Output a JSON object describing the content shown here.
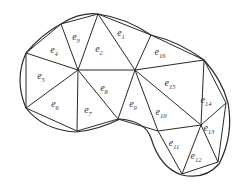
{
  "diagram": {
    "title": "",
    "type": "triangular finite element mesh over a curved domain",
    "colors": {
      "stroke": "#2a2a2a",
      "text": "#333333",
      "background": "#ffffff"
    },
    "nodes": {
      "A": [
        78,
        70
      ],
      "B": [
        135,
        70
      ],
      "C": [
        98,
        14
      ],
      "D": [
        151,
        35
      ],
      "E": [
        204,
        60
      ],
      "F": [
        61,
        24
      ],
      "G": [
        26,
        53
      ],
      "H": [
        26,
        108
      ],
      "I": [
        77,
        131
      ],
      "J": [
        118,
        119
      ],
      "K": [
        158,
        131
      ],
      "L": [
        201,
        125
      ],
      "M": [
        226,
        103
      ],
      "N": [
        182,
        174
      ],
      "O": [
        218,
        162
      ]
    },
    "elements": [
      {
        "id": "e1",
        "base": "e",
        "sub": "1",
        "nodes": [
          "C",
          "D",
          "B"
        ],
        "label_pos": [
          121,
          36
        ]
      },
      {
        "id": "e2",
        "base": "e",
        "sub": "2",
        "nodes": [
          "C",
          "B",
          "A"
        ],
        "label_pos": [
          99,
          52
        ]
      },
      {
        "id": "e3",
        "base": "e",
        "sub": "3",
        "nodes": [
          "F",
          "C",
          "A"
        ],
        "label_pos": [
          76,
          40
        ]
      },
      {
        "id": "e4",
        "base": "e",
        "sub": "4",
        "nodes": [
          "G",
          "F",
          "A"
        ],
        "label_pos": [
          54,
          53
        ]
      },
      {
        "id": "e5",
        "base": "e",
        "sub": "5",
        "nodes": [
          "G",
          "A",
          "H"
        ],
        "label_pos": [
          41,
          79
        ]
      },
      {
        "id": "e6",
        "base": "e",
        "sub": "6",
        "nodes": [
          "H",
          "A",
          "I"
        ],
        "label_pos": [
          55,
          107
        ]
      },
      {
        "id": "e7",
        "base": "e",
        "sub": "7",
        "nodes": [
          "A",
          "J",
          "I"
        ],
        "label_pos": [
          88,
          113
        ]
      },
      {
        "id": "e8",
        "base": "e",
        "sub": "8",
        "nodes": [
          "A",
          "B",
          "J"
        ],
        "label_pos": [
          104,
          91
        ]
      },
      {
        "id": "e9",
        "base": "e",
        "sub": "9",
        "nodes": [
          "B",
          "K",
          "J"
        ],
        "label_pos": [
          133,
          107
        ]
      },
      {
        "id": "e10",
        "base": "e",
        "sub": "10",
        "nodes": [
          "B",
          "L",
          "K"
        ],
        "label_pos": [
          161,
          115
        ]
      },
      {
        "id": "e11",
        "base": "e",
        "sub": "11",
        "nodes": [
          "K",
          "L",
          "N"
        ],
        "label_pos": [
          174,
          146
        ]
      },
      {
        "id": "e12",
        "base": "e",
        "sub": "12",
        "nodes": [
          "L",
          "O",
          "N"
        ],
        "label_pos": [
          196,
          159
        ]
      },
      {
        "id": "e13",
        "base": "e",
        "sub": "13",
        "nodes": [
          "L",
          "M",
          "O"
        ],
        "label_pos": [
          209,
          131
        ]
      },
      {
        "id": "e14",
        "base": "e",
        "sub": "14",
        "nodes": [
          "E",
          "M",
          "L"
        ],
        "label_pos": [
          206,
          103
        ]
      },
      {
        "id": "e15",
        "base": "e",
        "sub": "15",
        "nodes": [
          "B",
          "E",
          "L"
        ],
        "label_pos": [
          170,
          86
        ]
      },
      {
        "id": "e16",
        "base": "e",
        "sub": "16",
        "nodes": [
          "D",
          "E",
          "B"
        ],
        "label_pos": [
          160,
          55
        ]
      }
    ],
    "boundary_path": "M 61 24 Q 80 12 98 14 Q 126 18 151 35 Q 180 42 204 60 Q 222 80 228 103 Q 234 135 219 164 Q 205 180 182 175 Q 160 168 151 138 Q 145 121 120 119 Q 98 130 76 132 Q 43 130 26 108 Q 14 80 26 53 Q 42 34 61 24 Z"
  }
}
